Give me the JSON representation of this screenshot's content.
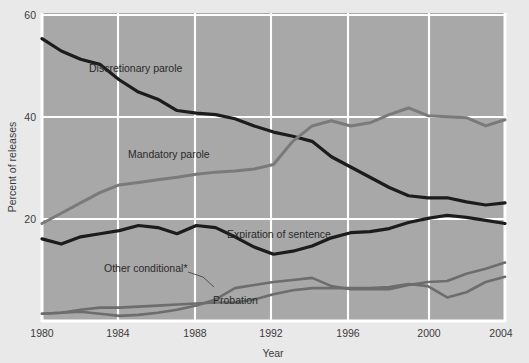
{
  "chart_data": {
    "type": "line",
    "title": "",
    "subtitle": "",
    "xlabel": "Year",
    "ylabel": "Percent of releases",
    "xlim": [
      1980,
      2004
    ],
    "ylim": [
      0,
      60
    ],
    "grid": true,
    "legend_position": "inline-annotations",
    "x": [
      1980,
      1981,
      1982,
      1983,
      1984,
      1985,
      1986,
      1987,
      1988,
      1989,
      1990,
      1991,
      1992,
      1993,
      1994,
      1995,
      1996,
      1997,
      1998,
      1999,
      2000,
      2001,
      2002,
      2003,
      2004
    ],
    "xticks": [
      "1980",
      "1984",
      "1988",
      "1992",
      "1996",
      "2000",
      "2004"
    ],
    "yticks": [
      "20",
      "40",
      "60"
    ],
    "series": [
      {
        "name": "Discretionary parole",
        "color": "#1c1c1c",
        "width": 3.2,
        "values": [
          55.0,
          52.6,
          51.0,
          50.0,
          47.0,
          44.6,
          43.2,
          41.0,
          40.5,
          40.2,
          39.4,
          38.0,
          36.8,
          36.0,
          35.0,
          32.0,
          30.0,
          28.0,
          26.0,
          24.4,
          24.0,
          24.0,
          23.2,
          22.6,
          23.0
        ]
      },
      {
        "name": "Mandatory parole",
        "color": "#7a7a7a",
        "width": 3.0,
        "values": [
          19.0,
          21.0,
          23.0,
          25.0,
          26.5,
          27.0,
          27.5,
          28.0,
          28.6,
          29.0,
          29.2,
          29.6,
          30.5,
          35.0,
          38.0,
          39.0,
          38.0,
          38.6,
          40.2,
          41.5,
          40.0,
          39.8,
          39.6,
          38.0,
          39.2
        ]
      },
      {
        "name": "Expiration of sentence",
        "color": "#1c1c1c",
        "width": 3.2,
        "values": [
          16.0,
          15.0,
          16.4,
          17.0,
          17.6,
          18.6,
          18.2,
          17.0,
          18.6,
          18.2,
          16.4,
          14.4,
          13.0,
          13.6,
          14.6,
          16.2,
          17.2,
          17.4,
          18.0,
          19.2,
          20.0,
          20.6,
          20.2,
          19.6,
          19.0
        ]
      },
      {
        "name": "Other conditional",
        "color": "#6d6d6d",
        "width": 2.6,
        "values": [
          1.4,
          1.6,
          1.8,
          1.4,
          1.0,
          1.2,
          1.6,
          2.2,
          3.0,
          4.2,
          6.4,
          7.0,
          7.6,
          8.0,
          8.4,
          6.8,
          6.2,
          6.2,
          6.2,
          7.0,
          7.6,
          7.8,
          9.2,
          10.2,
          11.4
        ]
      },
      {
        "name": "Probation",
        "color": "#6d6d6d",
        "width": 2.6,
        "values": [
          1.4,
          1.6,
          2.2,
          2.6,
          2.6,
          2.8,
          3.0,
          3.2,
          3.4,
          3.6,
          3.6,
          4.2,
          5.2,
          6.0,
          6.4,
          6.4,
          6.4,
          6.4,
          6.6,
          7.2,
          6.8,
          4.6,
          5.6,
          7.6,
          8.6
        ]
      }
    ],
    "annotations": [
      {
        "text": "Discretionary parole",
        "x": 89,
        "y": 72
      },
      {
        "text": "Mandatory parole",
        "x": 128,
        "y": 158
      },
      {
        "text": "Expiration of sentence",
        "x": 227,
        "y": 238
      },
      {
        "text": "Other conditional*",
        "x": 104,
        "y": 272
      },
      {
        "text": "Probation",
        "x": 213,
        "y": 304
      }
    ]
  },
  "axes": {
    "x_title": "Year",
    "y_title": "Percent of releases",
    "x_tick_labels": [
      "1980",
      "1984",
      "1988",
      "1992",
      "1996",
      "2000",
      "2004"
    ],
    "y_tick_labels": [
      "20",
      "40",
      "60"
    ]
  },
  "colors": {
    "page_background": "#e9e9e9",
    "plot_background": "#a8a8a8",
    "gridline": "#ffffff",
    "dark_series": "#1c1c1c",
    "gray_series": "#7a7a7a",
    "text": "#3b3b3b"
  }
}
